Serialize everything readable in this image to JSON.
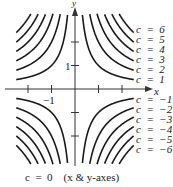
{
  "chart_data": {
    "type": "line",
    "title": "",
    "xlabel": "x",
    "ylabel": "y",
    "xlim": [
      -2.5,
      2.5
    ],
    "ylim": [
      -3.2,
      3.2
    ],
    "grid": false,
    "x_ticks": [
      -2,
      -1,
      1,
      2
    ],
    "x_tick_labels": [
      "",
      "−1",
      "",
      ""
    ],
    "y_ticks": [
      -2,
      -1,
      1,
      2
    ],
    "y_tick_labels": [
      "",
      "",
      "1",
      ""
    ],
    "series": [
      {
        "name": "c = 6",
        "c": 6
      },
      {
        "name": "c = 5",
        "c": 5
      },
      {
        "name": "c = 4",
        "c": 4
      },
      {
        "name": "c = 3",
        "c": 3
      },
      {
        "name": "c = 2",
        "c": 2
      },
      {
        "name": "c = 1",
        "c": 1
      },
      {
        "name": "c = −1",
        "c": -1
      },
      {
        "name": "c = −2",
        "c": -2
      },
      {
        "name": "c = −3",
        "c": -3
      },
      {
        "name": "c = −4",
        "c": -4
      },
      {
        "name": "c = −5",
        "c": -5
      },
      {
        "name": "c = −6",
        "c": -6
      }
    ],
    "annotations": [
      "c = 0   (x & y-axes)"
    ],
    "legend_position": "right (inline labels)"
  },
  "labels": {
    "x_axis": "x",
    "y_axis": "y",
    "x_tick": "−1",
    "y_tick": "1",
    "positive": [
      "c  =  6",
      "c  =  5",
      "c  =  4",
      "c  =  3",
      "c  =  2",
      "c  =  1"
    ],
    "negative": [
      "c  =  −1",
      "c  =  −2",
      "c  =  −3",
      "c  =  −4",
      "c  =  −5",
      "c  =  −6"
    ],
    "caption": "c  =  0    (x & y-axes)"
  },
  "colors": {
    "curve": "#1a1a1a",
    "axis": "#333333",
    "text": "#222222"
  }
}
